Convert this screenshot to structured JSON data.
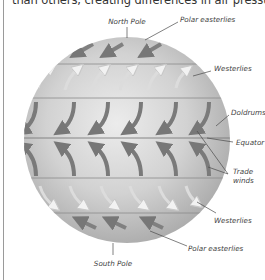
{
  "intro_text": "than others, creating differences in air pressure.",
  "diagram": {
    "labels": {
      "north_pole": "North Pole",
      "polar_easterlies_north": "Polar easterlies",
      "westerlies_north": "Westerlies",
      "doldrums": "Doldrums",
      "equator": "Equator",
      "trade_winds_line1": "Trade",
      "trade_winds_line2": "winds",
      "westerlies_south": "Westerlies",
      "polar_easterlies_south": "Polar easterlies",
      "south_pole": "South Pole"
    },
    "colors": {
      "globe_light": "#e4e4e4",
      "globe_mid": "#c4c4c4",
      "globe_dark": "#a8a8a8",
      "band_line": "#8a8a8a",
      "arrow_dark": "#7a7a7a",
      "arrow_light": "#d8d8d8",
      "leader_line": "#444444"
    }
  }
}
